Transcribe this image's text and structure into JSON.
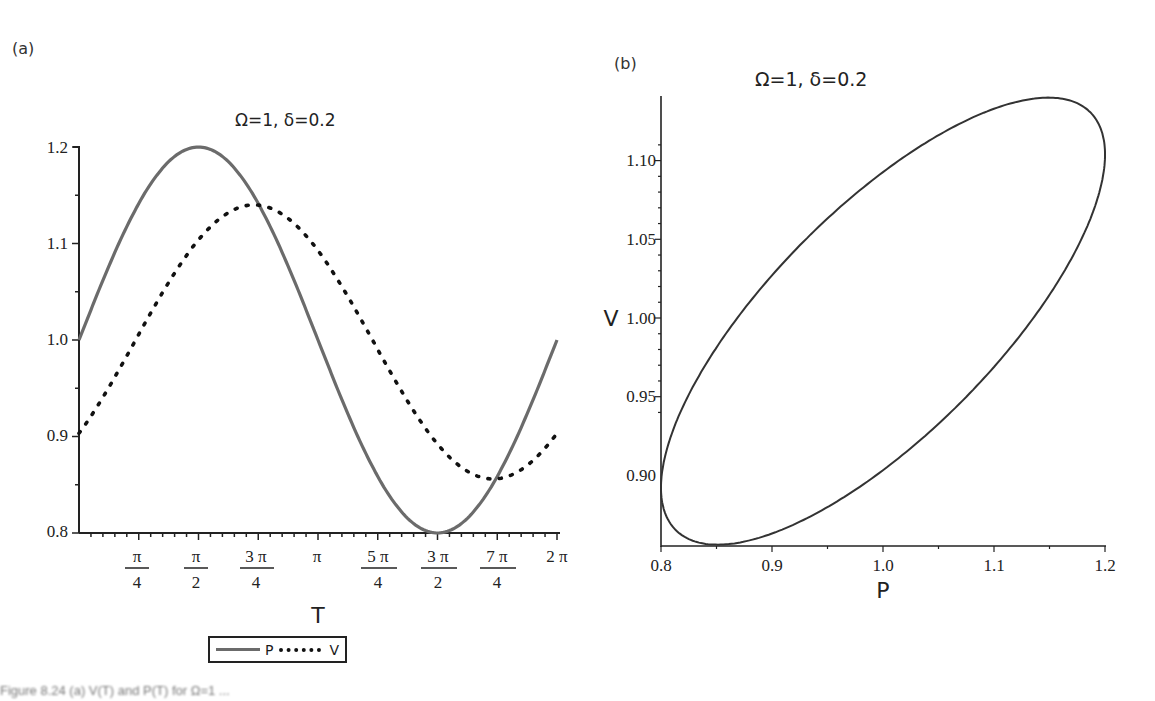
{
  "panels": {
    "a": {
      "label": "(a)",
      "title": "Ω=1, δ=0.2",
      "xlabel": "T",
      "y_ticks": [
        "1.2",
        "1.1",
        "1.0",
        "0.9",
        "0.8"
      ],
      "x_ticks": [
        {
          "num": "π",
          "den": "4"
        },
        {
          "num": "π",
          "den": "2"
        },
        {
          "num": "3 π",
          "den": "4"
        },
        {
          "num": "π",
          "den": ""
        },
        {
          "num": "5 π",
          "den": "4"
        },
        {
          "num": "3 π",
          "den": "2"
        },
        {
          "num": "7 π",
          "den": "4"
        },
        {
          "num": "2 π",
          "den": ""
        }
      ],
      "legend": {
        "p_label": "P",
        "v_label": "V"
      }
    },
    "b": {
      "label": "(b)",
      "title": "Ω=1, δ=0.2",
      "xlabel": "P",
      "ylabel": "V",
      "y_ticks": [
        "1.10",
        "1.05",
        "1.00",
        "0.95",
        "0.90"
      ],
      "x_ticks": [
        "0.8",
        "0.9",
        "1.0",
        "1.1",
        "1.2"
      ]
    }
  },
  "caption": "Figure 8.24 (a) V(T) and P(T) for Ω=1 ...",
  "colors": {
    "p_line": "#6b6b6b",
    "v_line": "#111111",
    "axis": "#222222"
  },
  "chart_data": [
    {
      "type": "line",
      "title": "Ω=1, δ=0.2",
      "xlabel": "T",
      "ylabel": "",
      "xlim": [
        0,
        6.2832
      ],
      "ylim": [
        0.8,
        1.2
      ],
      "x_tick_labels": [
        "π/4",
        "π/2",
        "3π/4",
        "π",
        "5π/4",
        "3π/2",
        "7π/4",
        "2π"
      ],
      "y_tick_labels": [
        "0.8",
        "0.9",
        "1.0",
        "1.1",
        "1.2"
      ],
      "legend_position": "bottom",
      "grid": false,
      "x": [
        0,
        0.7854,
        1.5708,
        2.3562,
        3.1416,
        3.927,
        4.7124,
        5.4978,
        6.2832
      ],
      "series": [
        {
          "name": "P",
          "style": "solid",
          "values": [
            1.0,
            1.141,
            1.2,
            1.141,
            1.0,
            0.859,
            0.8,
            0.859,
            1.0
          ]
        },
        {
          "name": "V",
          "style": "dotted",
          "values": [
            0.905,
            1.0,
            1.105,
            1.14,
            1.094,
            0.998,
            0.895,
            0.856,
            0.905
          ]
        }
      ]
    },
    {
      "type": "line",
      "title": "Ω=1, δ=0.2",
      "xlabel": "P",
      "ylabel": "V",
      "xlim": [
        0.8,
        1.2
      ],
      "ylim": [
        0.871,
        1.142
      ],
      "x_tick_labels": [
        "0.8",
        "0.9",
        "1.0",
        "1.1",
        "1.2"
      ],
      "y_tick_labels": [
        "0.90",
        "0.95",
        "1.00",
        "1.05",
        "1.10"
      ],
      "grid": false,
      "description": "Closed elliptical phase loop of V vs P, tilted along the diagonal",
      "points": {
        "P": [
          1.0,
          1.141,
          1.2,
          1.141,
          1.0,
          0.859,
          0.8,
          0.859,
          1.0
        ],
        "V": [
          0.905,
          1.0,
          1.105,
          1.14,
          1.094,
          0.998,
          0.895,
          0.856,
          0.905
        ]
      }
    }
  ]
}
